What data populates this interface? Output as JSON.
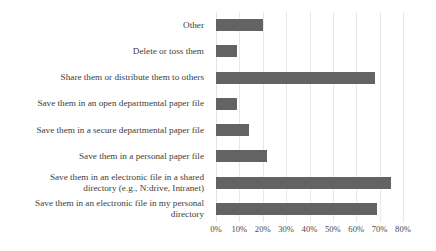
{
  "chart_data": {
    "type": "bar",
    "orientation": "horizontal",
    "title": "",
    "xlabel": "",
    "ylabel": "",
    "xlim": [
      0,
      80
    ],
    "grid": true,
    "legend": false,
    "bar_color": "#636363",
    "gridline_color": "#e8e8e8",
    "tick_suffix": "%",
    "tick_labels": [
      "0%",
      "10%",
      "20%",
      "30%",
      "40%",
      "50%",
      "60%",
      "70%",
      "80%"
    ],
    "tick_values": [
      0,
      10,
      20,
      30,
      40,
      50,
      60,
      70,
      80
    ],
    "categories": [
      "Other",
      "Delete or toss them",
      "Share them or distribute them to others",
      "Save them in an open departmental paper file",
      "Save them in a secure departmental paper file",
      "Save them in a personal paper file",
      "Save them in an electronic file in a shared directory (e.g., N:drive, Intranet)",
      "Save them in an electronic file in my personal directory"
    ],
    "category_lines": [
      [
        "Other"
      ],
      [
        "Delete or toss them"
      ],
      [
        "Share them or distribute them to others"
      ],
      [
        "Save them in an open departmental paper file"
      ],
      [
        "Save them in a secure departmental paper file"
      ],
      [
        "Save them in a personal paper file"
      ],
      [
        "Save them in an electronic file in a shared",
        "directory (e.g., N:drive, Intranet)"
      ],
      [
        "Save them in an electronic file in my personal",
        "directory"
      ]
    ],
    "values": [
      20,
      9,
      68,
      9,
      14,
      22,
      75,
      69
    ]
  }
}
